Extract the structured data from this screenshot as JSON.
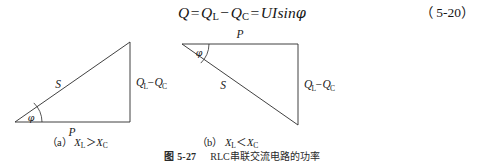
{
  "equation": {
    "lhs": "Q",
    "eq1": "=",
    "term1_base": "Q",
    "term1_sub": "L",
    "minus": "−",
    "term2_base": "Q",
    "term2_sub": "C",
    "eq2": "=",
    "rhs_ui": "UI",
    "rhs_fn": "sin",
    "rhs_phi": "φ",
    "number": "（ 5-20）"
  },
  "figure": {
    "left_diagram": {
      "name": "power-triangle-inductive",
      "hypotenuse_label": "S",
      "base_label": "P",
      "vertical_label_base1": "Q",
      "vertical_label_sub1": "L",
      "vertical_label_minus": "−",
      "vertical_label_base2": "Q",
      "vertical_label_sub2": "C",
      "angle_label": "φ",
      "vertices": {
        "bottom_left": [
          15,
          96
        ],
        "bottom_right": [
          130,
          96
        ],
        "top_right": [
          130,
          16
        ]
      }
    },
    "right_diagram": {
      "name": "power-triangle-capacitive",
      "hypotenuse_label": "S",
      "top_label": "P",
      "vertical_label_base1": "Q",
      "vertical_label_sub1": "L",
      "vertical_label_minus": "−",
      "vertical_label_base2": "Q",
      "vertical_label_sub2": "C",
      "angle_label": "φ",
      "vertices": {
        "top_left": [
          182,
          18
        ],
        "top_right": [
          298,
          18
        ],
        "bottom_right": [
          298,
          99
        ]
      }
    }
  },
  "subcaptions": {
    "a": {
      "tag": "（a）",
      "x_base1": "X",
      "x_sub1": "L",
      "relation": "＞",
      "x_base2": "X",
      "x_sub2": "C"
    },
    "b": {
      "tag": "（b）",
      "x_base1": "X",
      "x_sub1": "L",
      "relation": "＜",
      "x_base2": "X",
      "x_sub2": "C"
    }
  },
  "figure_caption": {
    "number": "图 5-27",
    "text": "RLC串联交流电路的功率"
  },
  "colors": {
    "ink": "#1a1a1a",
    "line": "#2b2b2b",
    "background": "#ffffff"
  }
}
